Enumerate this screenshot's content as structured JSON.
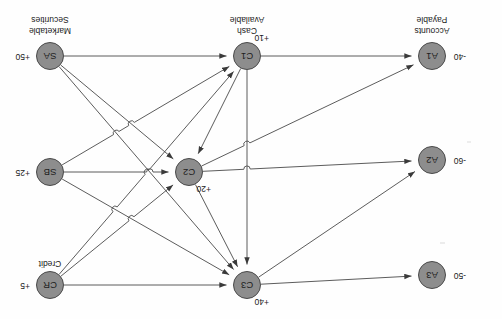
{
  "diagram": {
    "orientation_note": "rotated-180",
    "stroke_color": "#4a4a4a",
    "node_fill": "#8d8d8d",
    "background": "#fefefe",
    "nodes": [
      {
        "id": "A3",
        "label": "A3",
        "amount": "-50",
        "caption": "",
        "cx": 70,
        "cy": 44,
        "amount_dx": -26,
        "amount_dy": -4,
        "cap_dy": 0
      },
      {
        "id": "A2",
        "label": "A2",
        "amount": "-60",
        "caption": "",
        "cx": 70,
        "cy": 159,
        "amount_dx": -26,
        "amount_dy": -4,
        "cap_dy": 0
      },
      {
        "id": "A1",
        "label": "A1",
        "amount": "-40",
        "caption": "Accounts\nPayable",
        "cx": 70,
        "cy": 263,
        "amount_dx": -26,
        "amount_dy": -4,
        "cap_dy": 20
      },
      {
        "id": "C3",
        "label": "C3",
        "amount": "+40",
        "caption": "",
        "cx": 255,
        "cy": 34,
        "amount_dx": -14,
        "amount_dy": -20,
        "cap_dy": 0
      },
      {
        "id": "C2",
        "label": "C2",
        "amount": "+20",
        "caption": "",
        "cx": 313,
        "cy": 147,
        "amount_dx": -14,
        "amount_dy": -20,
        "cap_dy": 0
      },
      {
        "id": "C1",
        "label": "C1",
        "amount": "+10",
        "caption": "Cash\nAvailable",
        "cx": 255,
        "cy": 263,
        "amount_dx": -14,
        "amount_dy": 15,
        "cap_dy": 20
      },
      {
        "id": "CR",
        "label": "CR",
        "amount": "+5",
        "caption": "Credit",
        "cx": 452,
        "cy": 34,
        "amount_dx": 20,
        "amount_dy": -4,
        "cap_dy": 16
      },
      {
        "id": "SB",
        "label": "SB",
        "amount": "+25",
        "caption": "",
        "cx": 452,
        "cy": 147,
        "amount_dx": 20,
        "amount_dy": -4,
        "cap_dy": 0
      },
      {
        "id": "SA",
        "label": "SA",
        "amount": "+50",
        "caption": "Marketable\nSecurities",
        "cx": 452,
        "cy": 263,
        "amount_dx": 20,
        "amount_dy": -4,
        "cap_dy": 20
      }
    ],
    "edges": [
      {
        "from": "C3",
        "to": "A3",
        "name": "edge-c3-a3"
      },
      {
        "from": "C3",
        "to": "A2",
        "name": "edge-c3-a2"
      },
      {
        "from": "C2",
        "to": "A2",
        "name": "edge-c2-a2"
      },
      {
        "from": "C2",
        "to": "A1",
        "name": "edge-c2-a1"
      },
      {
        "from": "C1",
        "to": "A1",
        "name": "edge-c1-a1"
      },
      {
        "from": "CR",
        "to": "C3",
        "name": "edge-cr-c3"
      },
      {
        "from": "CR",
        "to": "C2",
        "name": "edge-cr-c2"
      },
      {
        "from": "CR",
        "to": "C1",
        "name": "edge-cr-c1"
      },
      {
        "from": "SB",
        "to": "C3",
        "name": "edge-sb-c3"
      },
      {
        "from": "SB",
        "to": "C2",
        "name": "edge-sb-c2"
      },
      {
        "from": "SB",
        "to": "C1",
        "name": "edge-sb-c1"
      },
      {
        "from": "SA",
        "to": "C3",
        "name": "edge-sa-c3"
      },
      {
        "from": "SA",
        "to": "C2",
        "name": "edge-sa-c2"
      },
      {
        "from": "SA",
        "to": "C1",
        "name": "edge-sa-c1"
      },
      {
        "from": "C1",
        "to": "C3",
        "name": "edge-c1-c3"
      },
      {
        "from": "C1",
        "to": "C2",
        "name": "edge-c1-c2"
      },
      {
        "from": "C2",
        "to": "C3",
        "name": "edge-c2-c3"
      }
    ]
  }
}
